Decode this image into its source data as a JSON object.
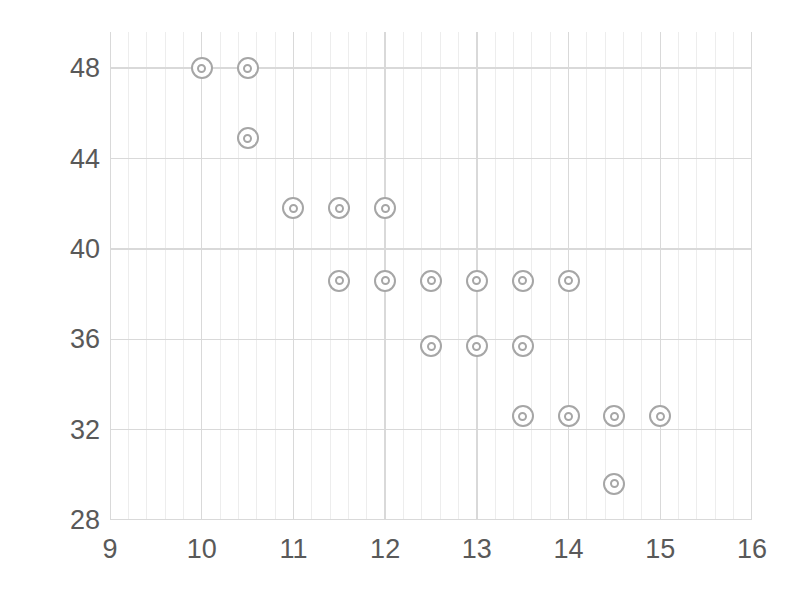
{
  "chart_data": {
    "type": "scatter",
    "title": "",
    "subtitle": "",
    "xlabel": "",
    "ylabel": "",
    "xlim": [
      9,
      16
    ],
    "ylim": [
      28,
      49.6
    ],
    "xticks": [
      9,
      10,
      11,
      12,
      13,
      14,
      15,
      16
    ],
    "yticks": [
      28,
      32,
      36,
      40,
      44,
      48
    ],
    "xtick_labels": [
      "9",
      "10",
      "11",
      "12",
      "13",
      "14",
      "15",
      "16"
    ],
    "ytick_labels": [
      "28",
      "32",
      "36",
      "40",
      "44",
      "48"
    ],
    "x_minor_step": 0.2,
    "y_major_step": 4,
    "grid": true,
    "grid_major_color": "#d9d9d9",
    "grid_minor_color": "#ededed",
    "legend": null,
    "legend_position": "none",
    "marker": "bullseye-double-circle",
    "marker_color": "#a6a6a6",
    "marker_fill": "#ffffff",
    "background_color": "#ffffff",
    "tick_label_color": "#595959",
    "annotations": [],
    "points": [
      {
        "x": 10.0,
        "y": 48.0
      },
      {
        "x": 10.5,
        "y": 48.0
      },
      {
        "x": 10.5,
        "y": 44.9
      },
      {
        "x": 11.0,
        "y": 41.8
      },
      {
        "x": 11.5,
        "y": 41.8
      },
      {
        "x": 12.0,
        "y": 41.8
      },
      {
        "x": 11.5,
        "y": 38.6
      },
      {
        "x": 12.0,
        "y": 38.6
      },
      {
        "x": 12.5,
        "y": 38.6
      },
      {
        "x": 13.0,
        "y": 38.6
      },
      {
        "x": 13.5,
        "y": 38.6
      },
      {
        "x": 14.0,
        "y": 38.6
      },
      {
        "x": 12.5,
        "y": 35.7
      },
      {
        "x": 13.0,
        "y": 35.7
      },
      {
        "x": 13.5,
        "y": 35.7
      },
      {
        "x": 13.5,
        "y": 32.6
      },
      {
        "x": 14.0,
        "y": 32.6
      },
      {
        "x": 14.5,
        "y": 32.6
      },
      {
        "x": 15.0,
        "y": 32.6
      },
      {
        "x": 14.5,
        "y": 29.6
      }
    ]
  }
}
